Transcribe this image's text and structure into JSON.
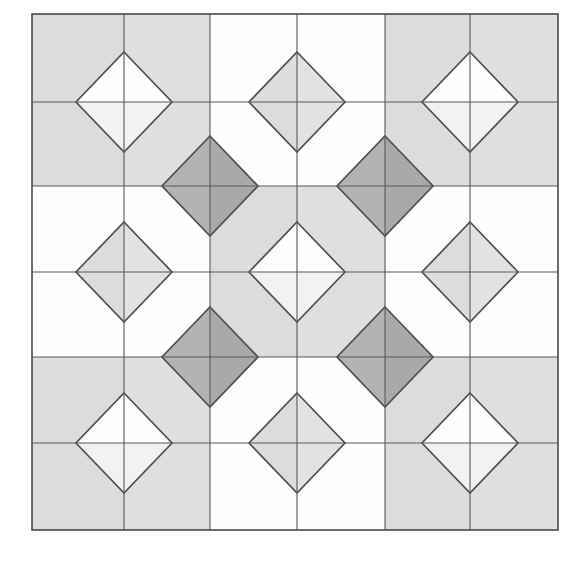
{
  "figure": {
    "title": "Quilt-style geometric tiling",
    "canvas": {
      "width": 586,
      "height": 567
    },
    "frame": {
      "x": 32,
      "y": 14,
      "width": 526,
      "height": 516
    },
    "grid": {
      "columns": 6,
      "rows": 6,
      "x_lines": [
        32,
        124,
        210,
        297,
        385,
        470,
        558
      ],
      "y_lines": [
        14,
        102,
        186,
        272,
        357,
        443,
        530
      ],
      "line_color": "#595959",
      "line_width": 1.1,
      "border_color": "#4a4a4a",
      "border_width": 1.6
    },
    "palette": {
      "white": "#fdfdfd",
      "light_gray": "#f2f2f2",
      "gray": "#dcdcdc",
      "gray_alt": "#e2e2e2",
      "dark_gray": "#b3b3b3",
      "dark_gray_alt": "#a9a9a9",
      "outline": "#4f4f4f",
      "background": "#ffffff"
    },
    "blocks": [
      {
        "block_row": 0,
        "block_col": 0,
        "tone": "gray"
      },
      {
        "block_row": 0,
        "block_col": 1,
        "tone": "white"
      },
      {
        "block_row": 0,
        "block_col": 2,
        "tone": "gray"
      },
      {
        "block_row": 1,
        "block_col": 0,
        "tone": "white"
      },
      {
        "block_row": 1,
        "block_col": 1,
        "tone": "gray"
      },
      {
        "block_row": 1,
        "block_col": 2,
        "tone": "white"
      },
      {
        "block_row": 2,
        "block_col": 0,
        "tone": "gray"
      },
      {
        "block_row": 2,
        "block_col": 1,
        "tone": "white"
      },
      {
        "block_row": 2,
        "block_col": 2,
        "tone": "gray"
      }
    ],
    "diamonds": [
      {
        "id": "diamond-top-left",
        "cx": 124,
        "cy": 102,
        "rx": 48,
        "ry": 50,
        "tone": "white",
        "position": "corner"
      },
      {
        "id": "diamond-top-center",
        "cx": 297,
        "cy": 102,
        "rx": 48,
        "ry": 50,
        "tone": "light",
        "position": "edge"
      },
      {
        "id": "diamond-top-right",
        "cx": 470,
        "cy": 102,
        "rx": 48,
        "ry": 50,
        "tone": "white",
        "position": "corner"
      },
      {
        "id": "diamond-middle-left",
        "cx": 124,
        "cy": 272,
        "rx": 48,
        "ry": 50,
        "tone": "light",
        "position": "edge"
      },
      {
        "id": "diamond-center",
        "cx": 297,
        "cy": 272,
        "rx": 48,
        "ry": 50,
        "tone": "white",
        "position": "center"
      },
      {
        "id": "diamond-middle-right",
        "cx": 470,
        "cy": 272,
        "rx": 48,
        "ry": 50,
        "tone": "light",
        "position": "edge"
      },
      {
        "id": "diamond-bottom-left",
        "cx": 124,
        "cy": 443,
        "rx": 48,
        "ry": 50,
        "tone": "white",
        "position": "corner"
      },
      {
        "id": "diamond-bottom-center",
        "cx": 297,
        "cy": 443,
        "rx": 48,
        "ry": 50,
        "tone": "light",
        "position": "edge"
      },
      {
        "id": "diamond-bottom-right",
        "cx": 470,
        "cy": 443,
        "rx": 48,
        "ry": 50,
        "tone": "white",
        "position": "corner"
      },
      {
        "id": "diamond-dark-upper-left",
        "cx": 210,
        "cy": 186,
        "rx": 48,
        "ry": 50,
        "tone": "dark",
        "position": "diagonal"
      },
      {
        "id": "diamond-dark-upper-right",
        "cx": 385,
        "cy": 186,
        "rx": 48,
        "ry": 50,
        "tone": "dark",
        "position": "diagonal"
      },
      {
        "id": "diamond-dark-lower-left",
        "cx": 210,
        "cy": 357,
        "rx": 48,
        "ry": 50,
        "tone": "dark",
        "position": "diagonal"
      },
      {
        "id": "diamond-dark-lower-right",
        "cx": 385,
        "cy": 357,
        "rx": 48,
        "ry": 50,
        "tone": "dark",
        "position": "diagonal"
      }
    ]
  }
}
